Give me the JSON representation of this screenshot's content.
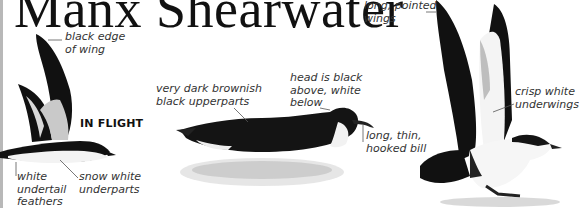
{
  "page": {
    "title": "Manx Shearwater",
    "section_tag": "IN FLIGHT"
  },
  "annotations": {
    "flight_wing_edge": "black edge\nof wing",
    "flight_undertail": "white\nundertail\nfeathers",
    "flight_underparts": "snow white\nunderparts",
    "swim_upperparts": "very dark brownish\nblack upperparts",
    "swim_head": "head is black\nabove, white\nbelow",
    "swim_bill": "long, thin,\nhooked bill",
    "standing_wings": "long, pointed\nwings",
    "standing_underwings": "crisp white\nunderwings"
  },
  "colors": {
    "ink": "#111111",
    "label_text": "#333333",
    "leader_line": "#555555",
    "underwing_gray": "#c9c9c9",
    "page_edge": "#b8b8b8"
  }
}
